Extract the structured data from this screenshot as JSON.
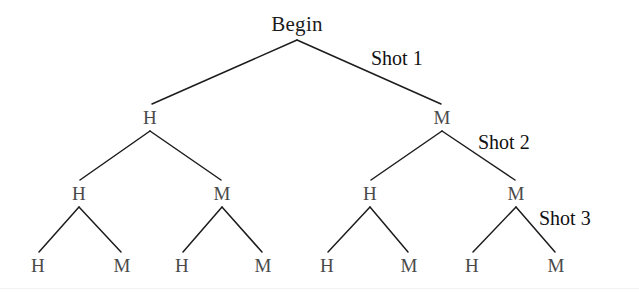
{
  "diagram": {
    "title_node": "Begin",
    "type": "binary-decision-tree",
    "background_color": "#ffffff",
    "edge_color": "#1c1c1c",
    "node_text_color": "#4a4a4a",
    "label_text_color": "#111111",
    "levels": [
      {
        "level": 1,
        "nodes": [
          {
            "id": "root",
            "label": "Begin",
            "x": 297,
            "y": 24
          }
        ]
      },
      {
        "level": 2,
        "stage_label": "Shot 1",
        "nodes": [
          {
            "id": "n-h",
            "label": "H",
            "x": 150,
            "y": 117
          },
          {
            "id": "n-m",
            "label": "M",
            "x": 442,
            "y": 117
          }
        ]
      },
      {
        "level": 3,
        "stage_label": "Shot 2",
        "nodes": [
          {
            "id": "n-hh",
            "label": "H",
            "x": 79,
            "y": 193
          },
          {
            "id": "n-hm",
            "label": "M",
            "x": 222,
            "y": 193
          },
          {
            "id": "n-mh",
            "label": "H",
            "x": 370,
            "y": 193
          },
          {
            "id": "n-mm",
            "label": "M",
            "x": 516,
            "y": 193
          }
        ]
      },
      {
        "level": 4,
        "stage_label": "Shot 3",
        "nodes": [
          {
            "id": "n-hhh",
            "label": "H",
            "x": 38,
            "y": 265
          },
          {
            "id": "n-hhm",
            "label": "M",
            "x": 122,
            "y": 265
          },
          {
            "id": "n-hmh",
            "label": "H",
            "x": 182,
            "y": 265
          },
          {
            "id": "n-hmm",
            "label": "M",
            "x": 263,
            "y": 265
          },
          {
            "id": "n-mhh",
            "label": "H",
            "x": 327,
            "y": 265
          },
          {
            "id": "n-mhm",
            "label": "M",
            "x": 409,
            "y": 265
          },
          {
            "id": "n-mmh",
            "label": "H",
            "x": 472,
            "y": 265
          },
          {
            "id": "n-mmm",
            "label": "M",
            "x": 556,
            "y": 265
          }
        ]
      }
    ],
    "stage_labels": [
      {
        "id": "shot-1",
        "text": "Shot 1",
        "x": 371,
        "y": 58
      },
      {
        "id": "shot-2",
        "text": "Shot 2",
        "x": 478,
        "y": 142
      },
      {
        "id": "shot-3",
        "text": "Shot 3",
        "x": 539,
        "y": 218
      }
    ],
    "edges": [
      {
        "from": "root",
        "to": "n-h",
        "x1": 297,
        "y1": 40,
        "x2": 152,
        "y2": 104
      },
      {
        "from": "root",
        "to": "n-m",
        "x1": 297,
        "y1": 40,
        "x2": 441,
        "y2": 104
      },
      {
        "from": "n-h",
        "to": "n-hh",
        "x1": 150,
        "y1": 131,
        "x2": 80,
        "y2": 180
      },
      {
        "from": "n-h",
        "to": "n-hm",
        "x1": 150,
        "y1": 131,
        "x2": 221,
        "y2": 180
      },
      {
        "from": "n-m",
        "to": "n-mh",
        "x1": 442,
        "y1": 131,
        "x2": 371,
        "y2": 180
      },
      {
        "from": "n-m",
        "to": "n-mm",
        "x1": 442,
        "y1": 131,
        "x2": 515,
        "y2": 180
      },
      {
        "from": "n-hh",
        "to": "n-hhh",
        "x1": 79,
        "y1": 207,
        "x2": 39,
        "y2": 252
      },
      {
        "from": "n-hh",
        "to": "n-hhm",
        "x1": 79,
        "y1": 207,
        "x2": 121,
        "y2": 252
      },
      {
        "from": "n-hm",
        "to": "n-hmh",
        "x1": 222,
        "y1": 207,
        "x2": 183,
        "y2": 252
      },
      {
        "from": "n-hm",
        "to": "n-hmm",
        "x1": 222,
        "y1": 207,
        "x2": 262,
        "y2": 252
      },
      {
        "from": "n-mh",
        "to": "n-mhh",
        "x1": 370,
        "y1": 207,
        "x2": 328,
        "y2": 252
      },
      {
        "from": "n-mh",
        "to": "n-mhm",
        "x1": 370,
        "y1": 207,
        "x2": 408,
        "y2": 252
      },
      {
        "from": "n-mm",
        "to": "n-mmh",
        "x1": 516,
        "y1": 207,
        "x2": 473,
        "y2": 252
      },
      {
        "from": "n-mm",
        "to": "n-mmm",
        "x1": 516,
        "y1": 207,
        "x2": 555,
        "y2": 252
      }
    ],
    "baseline_artifact_y": 288
  }
}
